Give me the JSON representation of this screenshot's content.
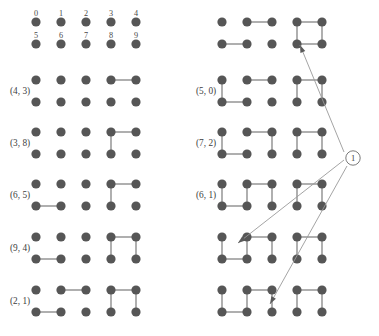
{
  "figure": {
    "width": 379,
    "height": 336,
    "background": "#ffffff",
    "node_color": "#565656",
    "edge_color": "#6e6e6e",
    "arrow_color": "#9a9a9a",
    "text_color": "#3d3d3d"
  },
  "legend": {
    "name": "node-index-legend",
    "top_row_labels": [
      "0",
      "1",
      "2",
      "3",
      "4"
    ],
    "bottom_row_labels": [
      "5",
      "6",
      "7",
      "8",
      "9"
    ],
    "origin_x": 36,
    "origin_y": 22,
    "col_spacing": 25,
    "row_spacing": 22,
    "node_radius": 4.6,
    "label_dy": -6.5
  },
  "grid": {
    "cols": 5,
    "rows": 2,
    "col_spacing": 25,
    "row_spacing": 22,
    "node_radius": 4.6
  },
  "columns": [
    {
      "name": "left-column",
      "label_x": 10,
      "graph_origin_x": 36,
      "rows": [
        {
          "name": "graph-cell-left-1",
          "label": "(4, 3)",
          "origin_y": 80,
          "edges": [
            [
              3,
              4
            ]
          ]
        },
        {
          "name": "graph-cell-left-2",
          "label": "(3, 8)",
          "origin_y": 132,
          "edges": [
            [
              3,
              4
            ],
            [
              3,
              8
            ]
          ]
        },
        {
          "name": "graph-cell-left-3",
          "label": "(6, 5)",
          "origin_y": 184,
          "edges": [
            [
              3,
              4
            ],
            [
              3,
              8
            ],
            [
              5,
              6
            ]
          ]
        },
        {
          "name": "graph-cell-left-4",
          "label": "(9, 4)",
          "origin_y": 237,
          "edges": [
            [
              3,
              4
            ],
            [
              3,
              8
            ],
            [
              5,
              6
            ],
            [
              4,
              9
            ]
          ]
        },
        {
          "name": "graph-cell-left-5",
          "label": "(2, 1)",
          "origin_y": 290,
          "edges": [
            [
              3,
              4
            ],
            [
              3,
              8
            ],
            [
              5,
              6
            ],
            [
              4,
              9
            ],
            [
              1,
              2
            ]
          ]
        }
      ]
    },
    {
      "name": "right-column",
      "label_x": 196,
      "graph_origin_x": 222,
      "rows": [
        {
          "name": "graph-cell-right-1",
          "label": "",
          "origin_y": 22,
          "edges": [
            [
              1,
              2
            ],
            [
              3,
              4
            ],
            [
              5,
              6
            ],
            [
              3,
              8
            ],
            [
              4,
              9
            ],
            [
              8,
              9
            ]
          ]
        },
        {
          "name": "graph-cell-right-2",
          "label": "(5, 0)",
          "origin_y": 80,
          "edges": [
            [
              1,
              2
            ],
            [
              3,
              4
            ],
            [
              5,
              6
            ],
            [
              3,
              8
            ],
            [
              4,
              9
            ],
            [
              0,
              5
            ]
          ]
        },
        {
          "name": "graph-cell-right-3",
          "label": "(7, 2)",
          "origin_y": 132,
          "edges": [
            [
              1,
              2
            ],
            [
              3,
              4
            ],
            [
              5,
              6
            ],
            [
              3,
              8
            ],
            [
              4,
              9
            ],
            [
              0,
              5
            ],
            [
              2,
              7
            ]
          ]
        },
        {
          "name": "graph-cell-right-4",
          "label": "(6, 1)",
          "origin_y": 184,
          "edges": [
            [
              1,
              2
            ],
            [
              3,
              4
            ],
            [
              5,
              6
            ],
            [
              3,
              8
            ],
            [
              4,
              9
            ],
            [
              0,
              5
            ],
            [
              2,
              7
            ],
            [
              1,
              6
            ]
          ]
        },
        {
          "name": "graph-cell-right-5",
          "label": "",
          "origin_y": 237,
          "edges": [
            [
              1,
              2
            ],
            [
              3,
              4
            ],
            [
              5,
              6
            ],
            [
              3,
              8
            ],
            [
              4,
              9
            ],
            [
              0,
              5
            ],
            [
              2,
              7
            ],
            [
              1,
              6
            ]
          ]
        },
        {
          "name": "graph-cell-right-6",
          "label": "",
          "origin_y": 290,
          "edges": [
            [
              1,
              2
            ],
            [
              3,
              4
            ],
            [
              5,
              6
            ],
            [
              3,
              8
            ],
            [
              4,
              9
            ],
            [
              0,
              5
            ],
            [
              2,
              7
            ],
            [
              1,
              6
            ]
          ]
        }
      ]
    }
  ],
  "marker": {
    "name": "callout-marker-1",
    "text": "1",
    "cx": 353,
    "cy": 158,
    "r": 7.2
  },
  "arrows": [
    {
      "name": "callout-arrow-to-top-right-graph",
      "from_x": 344,
      "from_y": 152,
      "to_x": 300,
      "to_y": 45
    },
    {
      "name": "callout-arrow-to-graph-right-5",
      "from_x": 344,
      "from_y": 160,
      "to_x": 238,
      "to_y": 243
    },
    {
      "name": "callout-arrow-to-graph-right-6",
      "from_x": 347,
      "from_y": 166,
      "to_x": 270,
      "to_y": 304
    }
  ]
}
